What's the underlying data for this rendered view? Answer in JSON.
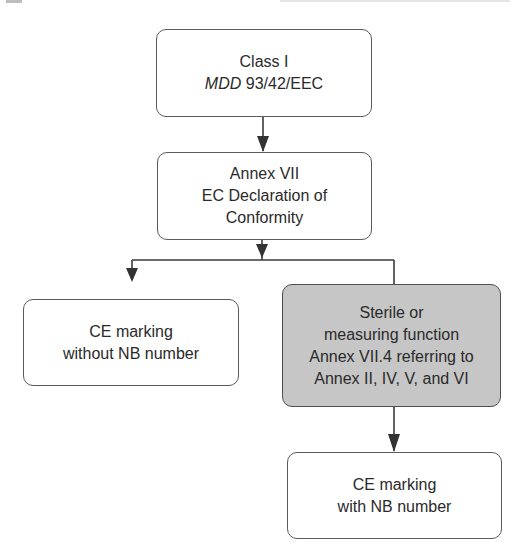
{
  "diagram": {
    "type": "flowchart",
    "colors": {
      "border": "#5a5a5a",
      "line": "#3a3a3a",
      "highlight_fill": "#c6c6c6",
      "box_fill": "#ffffff",
      "text": "#2a2a2a"
    },
    "nodes": [
      {
        "id": "class-i",
        "lines": [
          "Class I"
        ],
        "line2_italic": "MDD",
        "line2_rest": " 93/42/EEC"
      },
      {
        "id": "annex-vii",
        "lines": [
          "Annex VII",
          "EC Declaration of",
          "Conformity"
        ]
      },
      {
        "id": "ce-without-nb",
        "lines": [
          "CE marking",
          "without NB number"
        ]
      },
      {
        "id": "sterile-measuring",
        "lines": [
          "Sterile or",
          "measuring function",
          "Annex VII.4 referring to",
          "Annex II, IV, V, and VI"
        ]
      },
      {
        "id": "ce-with-nb",
        "lines": [
          "CE marking",
          "with NB number"
        ]
      }
    ],
    "edges": [
      {
        "from": "class-i",
        "to": "annex-vii"
      },
      {
        "from": "annex-vii",
        "to": "ce-without-nb"
      },
      {
        "from": "annex-vii",
        "to": "sterile-measuring"
      },
      {
        "from": "sterile-measuring",
        "to": "ce-with-nb"
      }
    ]
  }
}
